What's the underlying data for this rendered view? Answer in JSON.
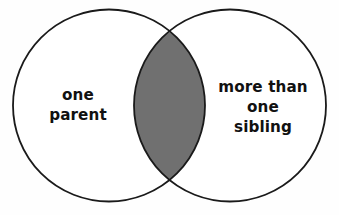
{
  "diagram": {
    "type": "venn-2-set",
    "title": "",
    "background_color": "#fefefe",
    "stroke_color": "#1a1a1a",
    "stroke_width": 1.8,
    "circle_fill": "#ffffff",
    "intersection_fill": "#707070",
    "intersection_shaded": true,
    "width": 339,
    "height": 215,
    "sets": [
      {
        "id": "left",
        "label": "one\nparent",
        "label_lines": [
          "one",
          "parent"
        ],
        "fill": "#ffffff",
        "center_x": 109,
        "center_y": 105.5,
        "radius": 96
      },
      {
        "id": "right",
        "label": "more than\none\nsibling",
        "label_lines": [
          "more than",
          "one",
          "sibling"
        ],
        "fill": "#ffffff",
        "center_x": 230,
        "center_y": 105.5,
        "radius": 96
      }
    ],
    "intersection": {
      "label": "",
      "fill": "#707070",
      "left_x": 137,
      "right_x": 203,
      "top_y": 32,
      "bottom_y": 178
    }
  }
}
